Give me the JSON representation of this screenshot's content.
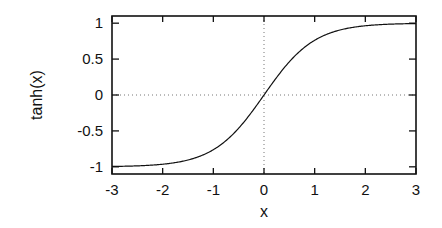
{
  "chart_data": {
    "type": "line",
    "title": "",
    "xlabel": "x",
    "ylabel": "tanh(x)",
    "xlim": [
      -3,
      3
    ],
    "ylim": [
      -1.1,
      1.1
    ],
    "x_ticks": [
      "-3",
      "-2",
      "-1",
      "0",
      "1",
      "2",
      "3"
    ],
    "y_ticks": [
      "1",
      "0.5",
      "0",
      "-0.5",
      "-1"
    ],
    "grid": false,
    "zero_lines": {
      "x0": true,
      "y0": true,
      "style": "dotted"
    },
    "series": [
      {
        "name": "tanh(x)",
        "x": [
          -3,
          -2.5,
          -2,
          -1.5,
          -1,
          -0.5,
          0,
          0.5,
          1,
          1.5,
          2,
          2.5,
          3
        ],
        "values": [
          -0.995,
          -0.987,
          -0.964,
          -0.905,
          -0.762,
          -0.462,
          0,
          0.462,
          0.762,
          0.905,
          0.964,
          0.987,
          0.995
        ]
      }
    ]
  }
}
